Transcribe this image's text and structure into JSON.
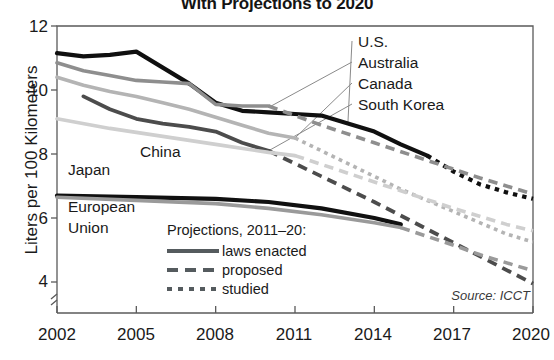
{
  "title": "With Projections to 2020",
  "source_note": "Source: ICCT",
  "axes": {
    "ylabel": "Liters per 100 Kilometers",
    "yticks": [
      12,
      10,
      8,
      6,
      4
    ],
    "xticks": [
      2002,
      2005,
      2008,
      2011,
      2014,
      2017,
      2020
    ]
  },
  "legend": {
    "title": "Projections, 2011–20:",
    "items": [
      {
        "label": "laws enacted",
        "style": "solid"
      },
      {
        "label": "proposed",
        "style": "dashed"
      },
      {
        "label": "studied",
        "style": "dotted"
      }
    ]
  },
  "series_labels": {
    "us": "U.S.",
    "australia": "Australia",
    "canada": "Canada",
    "south_korea": "South Korea",
    "china": "China",
    "japan": "Japan",
    "european_union": "European\nUnion",
    "european_union_l1": "European",
    "european_union_l2": "Union"
  },
  "colors": {
    "us": "#101010",
    "japan": "#101010",
    "south_korea": "#4c4c4c",
    "australia": "#8e8e8e",
    "canada": "#b4b4b4",
    "china": "#cfcfcf",
    "european_union": "#9a9a9a",
    "axis": "#5a5a5a",
    "text": "#1a1a1a"
  },
  "chart_data": {
    "type": "line",
    "title": "With Projections to 2020",
    "xlabel": "",
    "ylabel": "Liters per 100 Kilometers",
    "xlim": [
      2002,
      2020
    ],
    "ylim": [
      3.3,
      12
    ],
    "grid": false,
    "legend_position": "inside-lower-left",
    "annotations": [
      "Source: ICCT",
      "Projections, 2011–20: laws enacted / proposed / studied"
    ],
    "y_axis_break": true,
    "series": [
      {
        "name": "U.S.",
        "color": "#101010",
        "segments": [
          {
            "style": "solid",
            "x": [
              2002,
              2003,
              2004,
              2005,
              2006,
              2007,
              2008,
              2009,
              2010,
              2011,
              2012,
              2013,
              2014,
              2015,
              2016
            ],
            "y": [
              11.15,
              11.05,
              11.1,
              11.2,
              10.7,
              10.2,
              9.6,
              9.35,
              9.3,
              9.25,
              9.2,
              8.95,
              8.7,
              8.3,
              7.95
            ]
          },
          {
            "style": "dotted",
            "x": [
              2016,
              2017,
              2018,
              2019,
              2020
            ],
            "y": [
              7.95,
              7.45,
              7.05,
              6.8,
              6.6
            ]
          }
        ]
      },
      {
        "name": "Australia",
        "color": "#8e8e8e",
        "segments": [
          {
            "style": "solid",
            "x": [
              2002,
              2003,
              2004,
              2005,
              2006,
              2007,
              2008,
              2009,
              2010
            ],
            "y": [
              10.85,
              10.6,
              10.45,
              10.3,
              10.25,
              10.2,
              9.55,
              9.5,
              9.5
            ]
          },
          {
            "style": "dashed",
            "x": [
              2010,
              2012,
              2014,
              2016,
              2018,
              2020
            ],
            "y": [
              9.5,
              8.9,
              8.35,
              7.8,
              7.25,
              6.75
            ]
          }
        ]
      },
      {
        "name": "Canada",
        "color": "#b4b4b4",
        "segments": [
          {
            "style": "solid",
            "x": [
              2002,
              2003,
              2004,
              2005,
              2006,
              2007,
              2008,
              2009,
              2010,
              2011
            ],
            "y": [
              10.4,
              10.15,
              9.95,
              9.8,
              9.6,
              9.4,
              9.15,
              8.9,
              8.65,
              8.5
            ]
          },
          {
            "style": "dotted",
            "x": [
              2011,
              2013,
              2015,
              2017,
              2019,
              2020
            ],
            "y": [
              8.5,
              7.7,
              6.9,
              6.2,
              5.5,
              5.25
            ]
          }
        ]
      },
      {
        "name": "South Korea",
        "color": "#4c4c4c",
        "segments": [
          {
            "style": "solid",
            "x": [
              2003,
              2004,
              2005,
              2006,
              2007,
              2008,
              2009,
              2010
            ],
            "y": [
              9.8,
              9.4,
              9.1,
              8.95,
              8.85,
              8.7,
              8.35,
              8.1
            ]
          },
          {
            "style": "dashed",
            "x": [
              2010,
              2012,
              2014,
              2016,
              2018,
              2020
            ],
            "y": [
              8.1,
              7.3,
              6.5,
              5.65,
              4.8,
              3.95
            ]
          }
        ]
      },
      {
        "name": "China",
        "color": "#cfcfcf",
        "segments": [
          {
            "style": "solid",
            "x": [
              2002,
              2004,
              2006,
              2008,
              2010,
              2011
            ],
            "y": [
              9.1,
              8.8,
              8.55,
              8.3,
              8.05,
              7.95
            ]
          },
          {
            "style": "dashed",
            "x": [
              2011,
              2013,
              2015,
              2017,
              2019,
              2020
            ],
            "y": [
              7.95,
              7.4,
              6.85,
              6.3,
              5.8,
              5.6
            ]
          }
        ]
      },
      {
        "name": "Japan",
        "color": "#101010",
        "segments": [
          {
            "style": "solid",
            "x": [
              2002,
              2005,
              2008,
              2010,
              2012,
              2014,
              2015
            ],
            "y": [
              6.7,
              6.65,
              6.6,
              6.5,
              6.3,
              6.0,
              5.8
            ]
          }
        ]
      },
      {
        "name": "European Union",
        "color": "#9a9a9a",
        "segments": [
          {
            "style": "solid",
            "x": [
              2002,
              2005,
              2008,
              2010,
              2012,
              2014,
              2015
            ],
            "y": [
              6.65,
              6.55,
              6.45,
              6.3,
              6.1,
              5.85,
              5.7
            ]
          },
          {
            "style": "dashed",
            "x": [
              2015,
              2017,
              2018,
              2020
            ],
            "y": [
              5.7,
              5.15,
              4.85,
              4.35
            ]
          }
        ]
      }
    ]
  }
}
